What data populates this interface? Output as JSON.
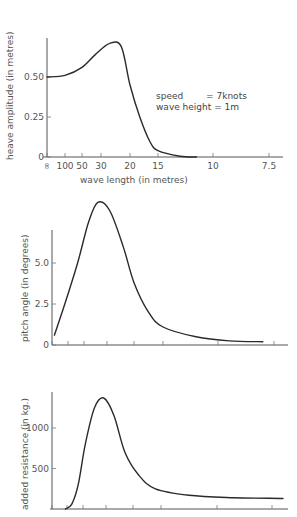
{
  "chart_data": [
    {
      "type": "line",
      "title": "",
      "xlabel": "wave length (in metres)",
      "ylabel": "heave amplitude (in metres)",
      "x_ticks": [
        "∞",
        "100",
        "50",
        "30",
        "20",
        "15",
        "10",
        "7.5"
      ],
      "y_ticks": [
        "0",
        "0.25",
        "0.50"
      ],
      "ylim": [
        0,
        0.75
      ],
      "grid": false,
      "annotation": [
        "speed        = 7knots",
        "wave height = 1m"
      ],
      "series": [
        {
          "name": "heave amplitude",
          "x_tick_index": [
            0,
            1,
            2,
            2.7,
            3.3,
            3.7,
            4.0,
            4.35,
            4.7,
            5.0,
            5.4,
            5.7
          ],
          "values": [
            0.5,
            0.51,
            0.56,
            0.64,
            0.71,
            0.69,
            0.45,
            0.25,
            0.1,
            0.04,
            0.005,
            0.0
          ]
        }
      ]
    },
    {
      "type": "line",
      "title": "",
      "xlabel": "",
      "ylabel": "pitch angle (in degrees)",
      "x_ticks": [
        "",
        "",
        "",
        "",
        "",
        "",
        "",
        ""
      ],
      "y_ticks": [
        "0",
        "2.5",
        "5.0"
      ],
      "ylim": [
        0,
        10
      ],
      "grid": false,
      "series": [
        {
          "name": "pitch angle",
          "x_tick_index": [
            0.15,
            0.8,
            1.6,
            2.2,
            2.6,
            3.1,
            3.6,
            4.0,
            4.5,
            5.0,
            5.6,
            6.2,
            6.8
          ],
          "values": [
            0.6,
            2.5,
            5.0,
            7.5,
            8.7,
            8.2,
            6.0,
            3.8,
            2.0,
            1.1,
            0.5,
            0.25,
            0.2
          ]
        }
      ]
    },
    {
      "type": "line",
      "title": "",
      "xlabel": "",
      "ylabel": "added resistance (in kg.)",
      "x_ticks": [
        "",
        "",
        "",
        "",
        "",
        "",
        "",
        ""
      ],
      "y_ticks": [
        "500",
        "1000"
      ],
      "ylim": [
        0,
        1500
      ],
      "grid": false,
      "series": [
        {
          "name": "added resistance",
          "x_tick_index": [
            0.9,
            1.3,
            1.7,
            2.1,
            2.5,
            2.9,
            3.3,
            3.7,
            4.2,
            4.8,
            5.5,
            6.3,
            7.2
          ],
          "values": [
            0,
            60,
            300,
            800,
            1250,
            1370,
            1150,
            700,
            420,
            250,
            170,
            140,
            130
          ]
        }
      ]
    }
  ]
}
